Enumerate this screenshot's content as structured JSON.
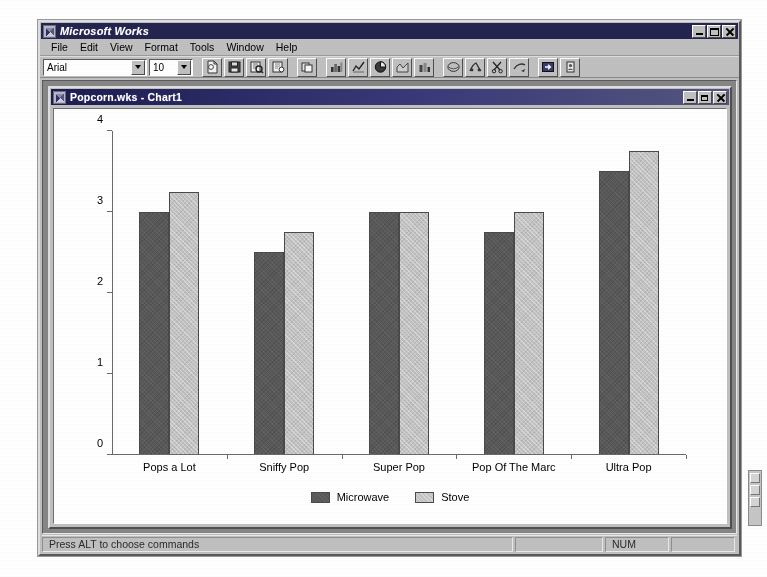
{
  "app": {
    "title": "Microsoft Works",
    "icon": "works-app-icon",
    "window_controls": {
      "minimize": "minimize-icon",
      "maximize": "maximize-icon",
      "close": "close-icon"
    }
  },
  "menu": {
    "items": [
      {
        "label": "File"
      },
      {
        "label": "Edit"
      },
      {
        "label": "View"
      },
      {
        "label": "Format"
      },
      {
        "label": "Tools"
      },
      {
        "label": "Window"
      },
      {
        "label": "Help"
      }
    ]
  },
  "toolbar": {
    "font_name": "Arial",
    "font_size": "10",
    "font_name_placeholder": "Arial",
    "font_size_placeholder": "10",
    "buttons": [
      {
        "name": "new-document-icon"
      },
      {
        "name": "save-icon"
      },
      {
        "name": "print-preview-icon"
      },
      {
        "name": "print-icon"
      },
      {
        "name": "copy-icon"
      },
      {
        "name": "bar-chart-icon"
      },
      {
        "name": "line-chart-icon"
      },
      {
        "name": "pie-chart-icon"
      },
      {
        "name": "area-chart-icon"
      },
      {
        "name": "stacked-bar-chart-icon"
      },
      {
        "name": "spell-check-icon"
      },
      {
        "name": "thesaurus-icon"
      },
      {
        "name": "cut-icon"
      },
      {
        "name": "paste-special-icon"
      },
      {
        "name": "insert-field-icon"
      },
      {
        "name": "address-book-icon"
      }
    ]
  },
  "document": {
    "title": "Popcorn.wks - Chart1",
    "icon": "chart-document-icon",
    "window_controls": {
      "minimize": "minimize-icon",
      "restore": "restore-icon",
      "close": "close-icon"
    }
  },
  "status": {
    "message": "Press ALT to choose commands",
    "pane_blank": "",
    "pane_num": "NUM",
    "pane_trailing": ""
  },
  "colors": {
    "series_microwave": "#595959",
    "series_stove": "#c3c3c3",
    "window_face": "#c0c0c0",
    "titlebar": "#242450",
    "mdi_background": "#868686",
    "plot_background": "#ffffff",
    "axis": "#6a6a6a"
  },
  "chart_data": {
    "type": "bar",
    "title": "",
    "subtitle": "",
    "xlabel": "",
    "ylabel": "",
    "categories": [
      "Pops a Lot",
      "Sniffy Pop",
      "Super Pop",
      "Pop Of The Marc",
      "Ultra Pop"
    ],
    "series": [
      {
        "name": "Microwave",
        "color": "#595959",
        "values": [
          3.0,
          2.5,
          3.0,
          2.75,
          3.5
        ]
      },
      {
        "name": "Stove",
        "color": "#c3c3c3",
        "values": [
          3.25,
          2.75,
          3.0,
          3.0,
          3.75
        ]
      }
    ],
    "ylim": [
      0,
      4
    ],
    "yticks": [
      0,
      1,
      2,
      3,
      4
    ],
    "ytick_labels": [
      "0",
      "1",
      "2",
      "3",
      "4"
    ],
    "grid": false,
    "legend_position": "bottom",
    "legend_entries": [
      "Microwave",
      "Stove"
    ],
    "annotations": []
  }
}
